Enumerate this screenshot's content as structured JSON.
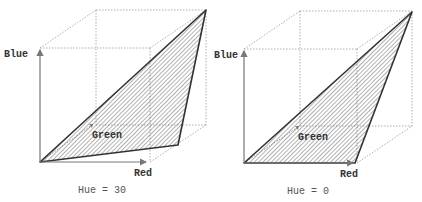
{
  "panels": [
    {
      "id": "hue-30",
      "caption": "Hue = 30",
      "axes": {
        "blue": "Blue",
        "green": "Green",
        "red": "Red"
      },
      "hue_degrees": 30
    },
    {
      "id": "hue-0",
      "caption": "Hue = 0",
      "axes": {
        "blue": "Blue",
        "green": "Green",
        "red": "Red"
      },
      "hue_degrees": 0
    }
  ],
  "colors": {
    "triangle_stroke": "#333333",
    "hatch": "#555555",
    "cube_lines": "#9a9a9a",
    "axes": "#777777"
  }
}
